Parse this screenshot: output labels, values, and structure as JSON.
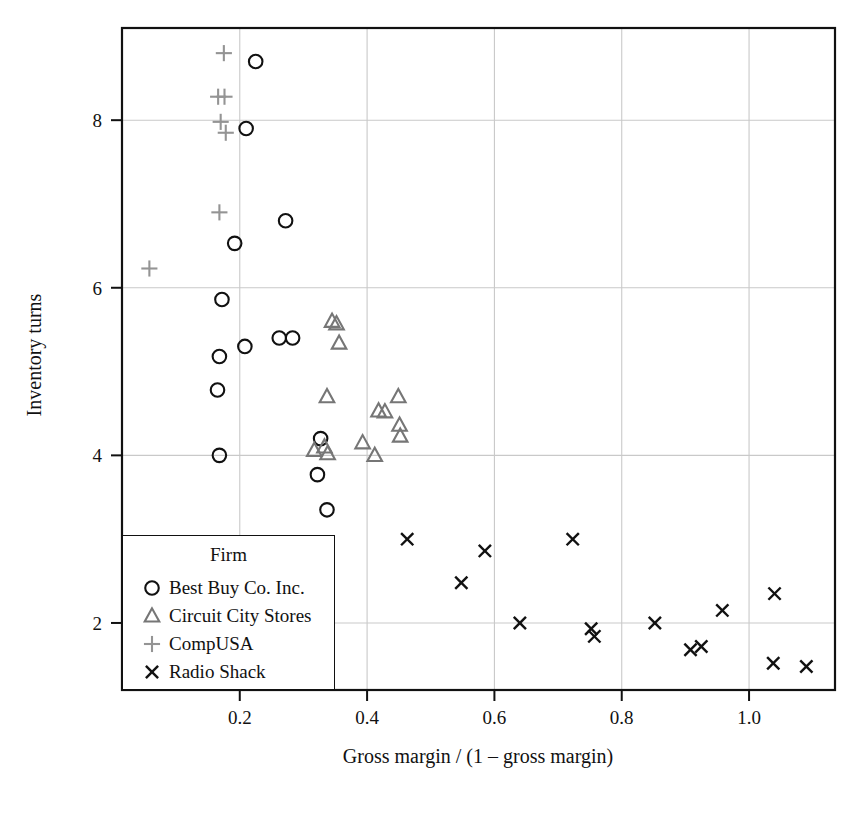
{
  "chart_data": {
    "type": "scatter",
    "title": "",
    "xlabel": "Gross margin / (1 – gross margin)",
    "ylabel": "Inventory turns",
    "xlim": [
      0.015,
      1.135
    ],
    "ylim": [
      1.2,
      9.1
    ],
    "xticks": [
      0.2,
      0.4,
      0.6,
      0.8,
      1.0
    ],
    "xticklabels": [
      "0.2",
      "0.4",
      "0.6",
      "0.8",
      "1.0"
    ],
    "yticks": [
      2,
      4,
      6,
      8
    ],
    "yticklabels": [
      "2",
      "4",
      "6",
      "8"
    ],
    "grid": true,
    "grid_color": "#c9c9c9",
    "legend": {
      "title": "Firm",
      "position": "lower-left-inside",
      "entries": [
        {
          "label": "Best Buy Co. Inc.",
          "marker": "circle",
          "color": "#111111"
        },
        {
          "label": "Circuit City Stores",
          "marker": "triangle",
          "color": "#767676"
        },
        {
          "label": "CompUSA",
          "marker": "plus",
          "color": "#949494"
        },
        {
          "label": "Radio Shack",
          "marker": "cross",
          "color": "#111111"
        }
      ]
    },
    "series": [
      {
        "name": "Best Buy Co. Inc.",
        "marker": "circle",
        "color": "#111111",
        "points": [
          [
            0.225,
            8.7
          ],
          [
            0.21,
            7.9
          ],
          [
            0.272,
            6.8
          ],
          [
            0.192,
            6.53
          ],
          [
            0.172,
            5.86
          ],
          [
            0.208,
            5.3
          ],
          [
            0.262,
            5.4
          ],
          [
            0.283,
            5.4
          ],
          [
            0.168,
            5.18
          ],
          [
            0.165,
            4.78
          ],
          [
            0.168,
            4.0
          ],
          [
            0.327,
            4.2
          ],
          [
            0.322,
            3.77
          ],
          [
            0.337,
            3.35
          ]
        ]
      },
      {
        "name": "Circuit City Stores",
        "marker": "triangle",
        "color": "#767676",
        "points": [
          [
            0.345,
            5.6
          ],
          [
            0.352,
            5.57
          ],
          [
            0.356,
            5.34
          ],
          [
            0.337,
            4.7
          ],
          [
            0.418,
            4.53
          ],
          [
            0.428,
            4.52
          ],
          [
            0.449,
            4.7
          ],
          [
            0.451,
            4.36
          ],
          [
            0.452,
            4.23
          ],
          [
            0.393,
            4.15
          ],
          [
            0.317,
            4.06
          ],
          [
            0.333,
            4.1
          ],
          [
            0.338,
            4.02
          ],
          [
            0.412,
            4.0
          ]
        ]
      },
      {
        "name": "CompUSA",
        "marker": "plus",
        "color": "#949494",
        "points": [
          [
            0.175,
            8.8
          ],
          [
            0.166,
            8.28
          ],
          [
            0.176,
            8.28
          ],
          [
            0.17,
            7.98
          ],
          [
            0.178,
            7.85
          ],
          [
            0.168,
            6.9
          ],
          [
            0.058,
            6.23
          ]
        ]
      },
      {
        "name": "Radio Shack",
        "marker": "cross",
        "color": "#111111",
        "points": [
          [
            0.463,
            3.0
          ],
          [
            0.723,
            3.0
          ],
          [
            0.585,
            2.86
          ],
          [
            0.548,
            2.48
          ],
          [
            0.958,
            2.15
          ],
          [
            1.04,
            2.35
          ],
          [
            0.64,
            2.0
          ],
          [
            0.852,
            2.0
          ],
          [
            0.752,
            1.93
          ],
          [
            0.757,
            1.84
          ],
          [
            0.908,
            1.68
          ],
          [
            0.925,
            1.72
          ],
          [
            1.038,
            1.52
          ],
          [
            1.09,
            1.48
          ]
        ]
      }
    ]
  }
}
